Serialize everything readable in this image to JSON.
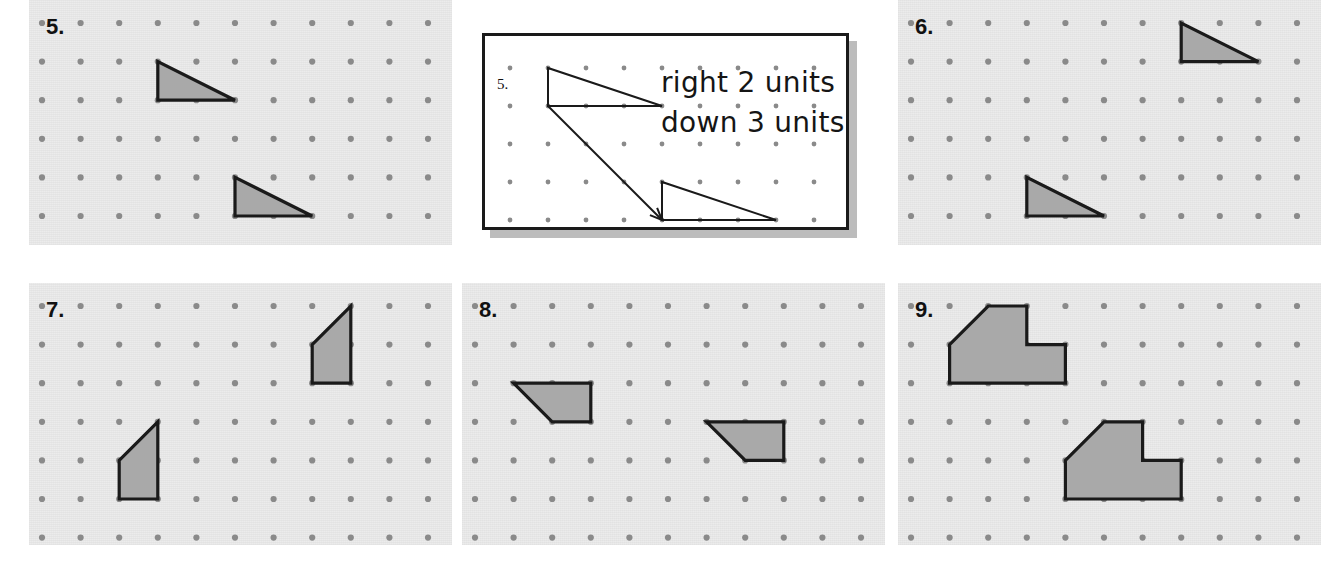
{
  "worksheet": {
    "title": "Translations on dot grids",
    "background_color": "#ffffff",
    "panel_background_color": "#ebebeb",
    "dot_color": "#8a8a8a",
    "shape_fill_color": "#a9a9a9",
    "shape_stroke_color": "#1a1a1a",
    "grid": {
      "spacing_px": 38.6,
      "origin_x_px": 13,
      "origin_y_px": 23,
      "cols": 11,
      "rows": 7
    }
  },
  "callout": {
    "number_label": "5.",
    "line1": "right 2 units",
    "line2": "down 3 units",
    "card_background": "#ffffff",
    "border_color": "#1a1a1a",
    "shadow_color": "#bcbcbc",
    "grid": {
      "spacing_px": 38,
      "origin_x_px": 25,
      "origin_y_px": 32,
      "cols": 9,
      "rows": 5
    },
    "diagram": {
      "source_triangle": [
        [
          1,
          0
        ],
        [
          1,
          1
        ],
        [
          4,
          1
        ]
      ],
      "image_triangle": [
        [
          4,
          3
        ],
        [
          4,
          4
        ],
        [
          7,
          4
        ]
      ],
      "arrow": {
        "from": [
          1,
          1
        ],
        "to": [
          4,
          4
        ]
      }
    }
  },
  "panels": [
    {
      "number_label": "5.",
      "position": {
        "left": 29,
        "top": 0,
        "width": 423,
        "height": 245
      },
      "shapes": [
        {
          "name": "source-triangle",
          "type": "triangle",
          "points": [
            [
              3,
              1
            ],
            [
              3,
              2
            ],
            [
              5,
              2
            ]
          ]
        },
        {
          "name": "image-triangle",
          "type": "triangle",
          "points": [
            [
              5,
              4
            ],
            [
              5,
              5
            ],
            [
              7,
              5
            ]
          ]
        }
      ]
    },
    {
      "number_label": "6.",
      "position": {
        "left": 898,
        "top": 0,
        "width": 423,
        "height": 245
      },
      "shapes": [
        {
          "name": "source-triangle",
          "type": "triangle",
          "points": [
            [
              7,
              0
            ],
            [
              7,
              1
            ],
            [
              9,
              1
            ]
          ]
        },
        {
          "name": "image-triangle",
          "type": "triangle",
          "points": [
            [
              3,
              4
            ],
            [
              3,
              5
            ],
            [
              5,
              5
            ]
          ]
        }
      ]
    },
    {
      "number_label": "7.",
      "position": {
        "left": 29,
        "top": 283,
        "width": 423,
        "height": 262
      },
      "shapes": [
        {
          "name": "source-trapezoid",
          "type": "trapezoid",
          "points": [
            [
              7,
              1
            ],
            [
              8,
              0
            ],
            [
              8,
              2
            ],
            [
              7,
              2
            ]
          ]
        },
        {
          "name": "image-trapezoid",
          "type": "trapezoid",
          "points": [
            [
              2,
              4
            ],
            [
              3,
              3
            ],
            [
              3,
              5
            ],
            [
              2,
              5
            ]
          ]
        }
      ]
    },
    {
      "number_label": "8.",
      "position": {
        "left": 462,
        "top": 283,
        "width": 423,
        "height": 262
      },
      "shapes": [
        {
          "name": "source-trapezoid",
          "type": "trapezoid",
          "points": [
            [
              1,
              2
            ],
            [
              3,
              2
            ],
            [
              3,
              3
            ],
            [
              2,
              3
            ]
          ]
        },
        {
          "name": "image-trapezoid",
          "type": "trapezoid",
          "points": [
            [
              6,
              3
            ],
            [
              8,
              3
            ],
            [
              8,
              4
            ],
            [
              7,
              4
            ]
          ]
        }
      ]
    },
    {
      "number_label": "9.",
      "position": {
        "left": 898,
        "top": 283,
        "width": 423,
        "height": 262
      },
      "shapes": [
        {
          "name": "source-hexagon",
          "type": "hexagon",
          "points": [
            [
              1,
              1
            ],
            [
              2,
              0
            ],
            [
              3,
              0
            ],
            [
              3,
              1
            ],
            [
              4,
              1
            ],
            [
              4,
              2
            ],
            [
              1,
              2
            ]
          ]
        },
        {
          "name": "image-hexagon",
          "type": "hexagon",
          "points": [
            [
              4,
              4
            ],
            [
              5,
              3
            ],
            [
              6,
              3
            ],
            [
              6,
              4
            ],
            [
              7,
              4
            ],
            [
              7,
              5
            ],
            [
              4,
              5
            ]
          ]
        }
      ]
    }
  ]
}
